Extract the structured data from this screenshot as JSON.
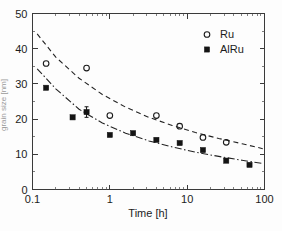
{
  "chart_data": {
    "type": "scatter",
    "title": "",
    "xlabel": "Time [h]",
    "ylabel": "",
    "xscale": "log",
    "yscale": "linear",
    "xlim": [
      0.1,
      100
    ],
    "ylim": [
      0,
      50
    ],
    "xticks": [
      "0.1",
      "1",
      "10",
      "100"
    ],
    "xtick_values": [
      0.1,
      1,
      10,
      100
    ],
    "yticks": [
      "0",
      "10",
      "20",
      "30",
      "40",
      "50"
    ],
    "ytick_values": [
      0,
      10,
      20,
      30,
      40,
      50
    ],
    "grid": false,
    "legend_position": "top-right",
    "series": [
      {
        "name": "Ru",
        "marker": "open-circle",
        "fit_style": "dashed",
        "x": [
          0.15,
          0.5,
          1.0,
          4.0,
          8.0,
          16.0,
          32.0
        ],
        "y": [
          35.8,
          34.5,
          21.0,
          21.0,
          18.0,
          14.8,
          13.4
        ],
        "fit_x": [
          0.115,
          0.2,
          0.4,
          0.8,
          1.6,
          3.2,
          6.4,
          12.8,
          25.6,
          51.2,
          95.0
        ],
        "fit_y": [
          44.2,
          37.6,
          31.6,
          27.0,
          23.4,
          20.5,
          18.2,
          16.2,
          14.5,
          13.0,
          11.6
        ]
      },
      {
        "name": "AlRu",
        "marker": "filled-square",
        "fit_style": "dash-dot",
        "x": [
          0.15,
          0.33,
          0.5,
          1.0,
          2.0,
          4.0,
          8.0,
          16.0,
          32.0,
          64.0
        ],
        "y": [
          28.9,
          20.5,
          22.0,
          15.5,
          16.0,
          14.1,
          13.2,
          11.2,
          8.2,
          7.0
        ],
        "errorbars": [
          {
            "x": 0.5,
            "y": 22.0,
            "yerr": 1.5
          }
        ],
        "fit_x": [
          0.115,
          0.2,
          0.4,
          0.8,
          1.6,
          3.2,
          6.4,
          12.8,
          25.6,
          51.2,
          95.0
        ],
        "fit_y": [
          34.3,
          28.6,
          22.8,
          18.9,
          16.0,
          13.8,
          12.1,
          10.6,
          9.4,
          8.3,
          7.4
        ]
      }
    ]
  },
  "axes": {
    "xlabel": "Time [h]",
    "xtick_labels": [
      "0.1",
      "1",
      "10",
      "100"
    ],
    "ytick_labels": [
      "0",
      "10",
      "20",
      "30",
      "40",
      "50"
    ],
    "ylabel_faint": "grain size [nm]"
  },
  "legend": {
    "entries": [
      {
        "label": "Ru",
        "marker": "open-circle"
      },
      {
        "label": "AlRu",
        "marker": "filled-square"
      }
    ]
  }
}
